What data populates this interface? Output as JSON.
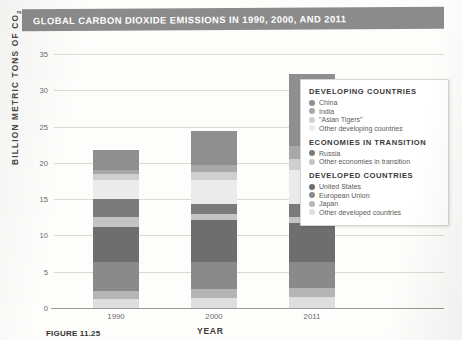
{
  "title": "GLOBAL CARBON DIOXIDE EMISSIONS IN 1990, 2000, AND 2011",
  "caption": {
    "figure_number": "FIGURE 11.25",
    "text": ""
  },
  "colors": {
    "title_bar": "#8b8b8b",
    "china": "#8f8f8f",
    "india": "#a8a8a8",
    "asian_tigers": "#cfcfcf",
    "other_developing": "#ebebeb",
    "russia": "#7b7b7b",
    "other_transition": "#c4c4c4",
    "united_states": "#6e6e6e",
    "european_union": "#8a8a8a",
    "japan": "#b5b5b5",
    "other_developed": "#dedede",
    "gridline": "#dddad6",
    "axis": "#9a9894"
  },
  "legend": {
    "groups": [
      {
        "heading": "DEVELOPING COUNTRIES",
        "items": [
          {
            "label": "China",
            "color": "#8f8f8f"
          },
          {
            "label": "India",
            "color": "#a8a8a8"
          },
          {
            "label": "\"Asian Tigers\"",
            "color": "#cfcfcf"
          },
          {
            "label": "Other developing countries",
            "color": "#ebebeb"
          }
        ]
      },
      {
        "heading": "ECONOMIES IN TRANSITION",
        "items": [
          {
            "label": "Russia",
            "color": "#7b7b7b"
          },
          {
            "label": "Other economies in transition",
            "color": "#c4c4c4"
          }
        ]
      },
      {
        "heading": "DEVELOPED COUNTRIES",
        "items": [
          {
            "label": "United States",
            "color": "#6e6e6e"
          },
          {
            "label": "European Union",
            "color": "#8a8a8a"
          },
          {
            "label": "Japan",
            "color": "#b5b5b5"
          },
          {
            "label": "Other developed countries",
            "color": "#dedede"
          }
        ]
      }
    ]
  },
  "chart_data": {
    "type": "bar",
    "stacked": true,
    "title": "GLOBAL CARBON DIOXIDE EMISSIONS IN 1990, 2000, AND 2011",
    "xlabel": "YEAR",
    "ylabel": "BILLION METRIC TONS OF CO2",
    "categories": [
      "1990",
      "2000",
      "2011"
    ],
    "ylim": [
      0,
      35
    ],
    "yticks": [
      0,
      5,
      10,
      15,
      20,
      25,
      30,
      35
    ],
    "grid": true,
    "legend_position": "right-inside",
    "totals": [
      21.8,
      24.4,
      32.3
    ],
    "series": [
      {
        "name": "Other developed countries",
        "color": "#dedede",
        "values": [
          1.3,
          1.4,
          1.5
        ]
      },
      {
        "name": "Japan",
        "color": "#b5b5b5",
        "values": [
          1.1,
          1.2,
          1.3
        ]
      },
      {
        "name": "European Union",
        "color": "#8a8a8a",
        "values": [
          4.0,
          3.8,
          3.6
        ]
      },
      {
        "name": "United States",
        "color": "#6e6e6e",
        "values": [
          4.8,
          5.7,
          5.3
        ]
      },
      {
        "name": "Other economies in transition",
        "color": "#c4c4c4",
        "values": [
          1.4,
          0.8,
          0.9
        ]
      },
      {
        "name": "Russia",
        "color": "#7b7b7b",
        "values": [
          2.4,
          1.5,
          1.8
        ]
      },
      {
        "name": "Other developing countries",
        "color": "#ebebeb",
        "values": [
          2.7,
          3.2,
          4.6
        ]
      },
      {
        "name": "\"Asian Tigers\"",
        "color": "#cfcfcf",
        "values": [
          0.7,
          1.2,
          1.5
        ]
      },
      {
        "name": "India",
        "color": "#a8a8a8",
        "values": [
          0.6,
          0.9,
          1.8
        ]
      },
      {
        "name": "China",
        "color": "#8f8f8f",
        "values": [
          2.8,
          4.7,
          10.0
        ]
      }
    ]
  }
}
